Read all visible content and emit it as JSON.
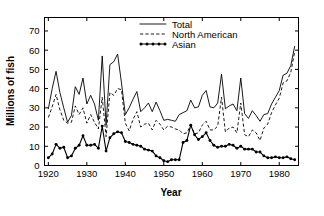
{
  "chart_data": {
    "type": "line",
    "title": "",
    "xlabel": "Year",
    "ylabel": "Millions of fish",
    "xlim": [
      1919,
      1985
    ],
    "ylim": [
      0,
      77
    ],
    "xticks": [
      1920,
      1930,
      1940,
      1950,
      1960,
      1970,
      1980
    ],
    "yticks": [
      0,
      10,
      20,
      30,
      40,
      50,
      60,
      70
    ],
    "grid": false,
    "legend_position": "top-center",
    "x": [
      1920,
      1921,
      1922,
      1923,
      1924,
      1925,
      1926,
      1927,
      1928,
      1929,
      1930,
      1931,
      1932,
      1933,
      1934,
      1935,
      1936,
      1937,
      1938,
      1939,
      1940,
      1941,
      1942,
      1943,
      1944,
      1945,
      1946,
      1947,
      1948,
      1949,
      1950,
      1951,
      1952,
      1953,
      1954,
      1955,
      1956,
      1957,
      1958,
      1959,
      1960,
      1961,
      1962,
      1963,
      1964,
      1965,
      1966,
      1967,
      1968,
      1969,
      1970,
      1971,
      1972,
      1973,
      1974,
      1975,
      1976,
      1977,
      1978,
      1979,
      1980,
      1981,
      1982,
      1983,
      1984
    ],
    "series": [
      {
        "name": "Total",
        "style": "solid",
        "values": [
          29.5,
          40.0,
          49.0,
          38.0,
          30.0,
          22.5,
          26.0,
          41.0,
          37.0,
          45.5,
          32.0,
          36.5,
          32.0,
          23.5,
          57.0,
          21.0,
          52.5,
          54.0,
          58.0,
          43.0,
          26.5,
          30.0,
          34.5,
          38.5,
          28.0,
          30.0,
          32.5,
          28.0,
          33.0,
          28.5,
          23.5,
          24.0,
          23.5,
          23.0,
          26.5,
          27.5,
          28.5,
          34.0,
          30.0,
          30.5,
          36.5,
          39.0,
          30.5,
          30.0,
          32.5,
          47.5,
          29.5,
          31.0,
          32.0,
          28.5,
          45.5,
          27.0,
          24.5,
          28.5,
          26.0,
          23.0,
          26.5,
          27.0,
          32.0,
          35.5,
          39.0,
          47.0,
          48.0,
          52.0,
          62.0
        ]
      },
      {
        "name": "North American",
        "style": "dashed",
        "values": [
          25.0,
          30.5,
          37.0,
          29.0,
          23.5,
          22.0,
          22.5,
          31.0,
          26.5,
          30.0,
          22.0,
          26.5,
          22.5,
          19.0,
          35.5,
          15.0,
          38.0,
          36.5,
          40.0,
          39.5,
          22.0,
          18.0,
          24.0,
          28.0,
          20.0,
          21.5,
          22.0,
          18.5,
          23.5,
          21.5,
          18.5,
          20.5,
          20.0,
          19.0,
          18.5,
          16.5,
          17.0,
          21.0,
          16.5,
          17.0,
          21.0,
          23.0,
          18.5,
          18.5,
          20.5,
          35.5,
          17.5,
          19.5,
          20.0,
          17.0,
          32.5,
          16.0,
          15.0,
          18.5,
          17.0,
          13.0,
          19.5,
          21.5,
          27.5,
          31.5,
          35.0,
          43.0,
          44.0,
          48.5,
          59.0
        ]
      },
      {
        "name": "Asian",
        "style": "dotted-markers",
        "values": [
          4.0,
          6.0,
          11.0,
          9.0,
          9.5,
          4.0,
          5.0,
          9.0,
          10.5,
          15.5,
          10.5,
          10.5,
          11.0,
          9.0,
          20.5,
          7.5,
          14.5,
          16.5,
          17.5,
          17.0,
          12.5,
          12.0,
          11.0,
          10.5,
          10.0,
          8.5,
          8.0,
          7.5,
          5.0,
          4.0,
          2.5,
          2.0,
          3.0,
          3.0,
          3.0,
          12.0,
          13.0,
          21.0,
          16.0,
          13.5,
          15.0,
          17.0,
          13.0,
          10.5,
          9.5,
          10.0,
          10.0,
          11.0,
          10.5,
          9.0,
          10.0,
          8.5,
          8.5,
          8.5,
          7.0,
          7.0,
          5.0,
          4.0,
          4.0,
          4.5,
          4.0,
          4.0,
          4.5,
          3.5,
          3.0
        ]
      }
    ]
  },
  "axes": {
    "ylabel": "Millions of fish",
    "xlabel": "Year",
    "ytick_labels": [
      "0",
      "10",
      "20",
      "30",
      "40",
      "50",
      "60",
      "70"
    ],
    "xtick_labels": [
      "1920",
      "1930",
      "1940",
      "1950",
      "1960",
      "1970",
      "1980"
    ]
  },
  "legend": {
    "entries": [
      {
        "label": "Total",
        "style": "solid"
      },
      {
        "label": "North American",
        "style": "dashed"
      },
      {
        "label": "Asian",
        "style": "dotted-markers"
      }
    ]
  },
  "colors": {
    "ink": "#000000",
    "background": "#ffffff"
  }
}
